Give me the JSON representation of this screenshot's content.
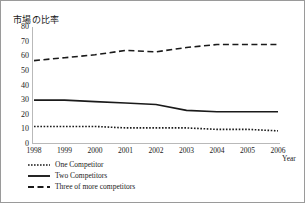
{
  "chart_data": {
    "type": "line",
    "title": "市場の比率",
    "xlabel": "Year",
    "ylabel": "",
    "categories": [
      "1998",
      "1999",
      "2000",
      "2001",
      "2002",
      "2003",
      "2004",
      "2005",
      "2006"
    ],
    "x": [
      1998,
      1999,
      2000,
      2001,
      2002,
      2003,
      2004,
      2005,
      2006
    ],
    "xlim": [
      1998,
      2006
    ],
    "ylim": [
      0,
      80
    ],
    "yticks": [
      0,
      10,
      20,
      30,
      40,
      50,
      60,
      70,
      80
    ],
    "grid": false,
    "legend_position": "below-axes-left",
    "series": [
      {
        "name": "One Competitor",
        "style": "dotted",
        "color": "#1a1a1a",
        "values": [
          12,
          12,
          12,
          11,
          11,
          11,
          10,
          10,
          9
        ]
      },
      {
        "name": "Two Competitors",
        "style": "solid",
        "color": "#1a1a1a",
        "values": [
          30,
          30,
          29,
          28,
          27,
          23,
          22,
          22,
          22
        ]
      },
      {
        "name": "Three of more competitors",
        "style": "dashed",
        "color": "#1a1a1a",
        "values": [
          57,
          59,
          61,
          64,
          63,
          66,
          68,
          68,
          68
        ]
      }
    ]
  },
  "axes": {
    "y_tick_labels": [
      "80",
      "70",
      "60",
      "50",
      "40",
      "30",
      "20",
      "10",
      "0"
    ],
    "x_tick_labels": [
      "1998",
      "1999",
      "2000",
      "2001",
      "2002",
      "2003",
      "2004",
      "2005",
      "2006"
    ],
    "x_axis_label": "Year"
  },
  "legend": {
    "items": [
      {
        "label": "One Competitor",
        "key": "dotted-line-key"
      },
      {
        "label": "Two Competitors",
        "key": "solid-line-key"
      },
      {
        "label": "Three of more competitors",
        "key": "dashed-line-key"
      }
    ]
  },
  "colors": {
    "ink": "#1a1a1a",
    "axis": "#b9b9b9",
    "frame": "#9a9a9a"
  }
}
